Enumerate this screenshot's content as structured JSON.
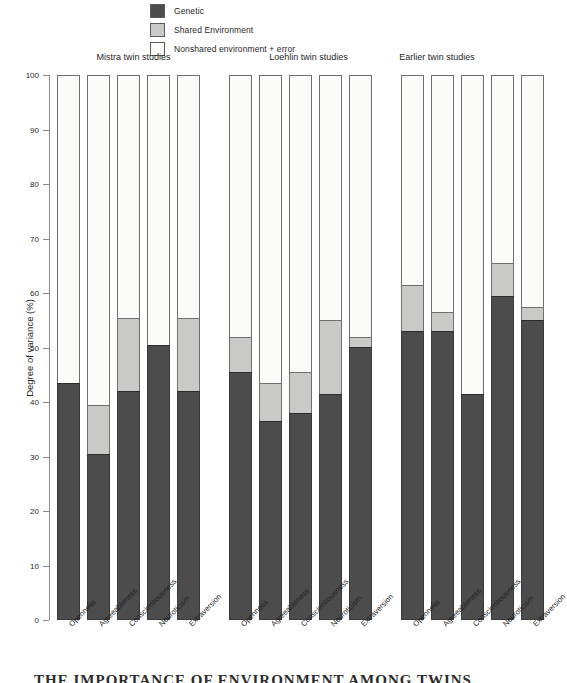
{
  "legend": {
    "items": [
      {
        "label": "Genetic",
        "color": "#4c4c4c",
        "key": "genetic"
      },
      {
        "label": "Shared Environment",
        "color": "#c9c9c7",
        "key": "shared"
      },
      {
        "label": "Nonshared environment + error",
        "color": "#fbfbfa",
        "key": "nonshared"
      }
    ]
  },
  "axis": {
    "ylabel": "Degree of variance (%)",
    "ticks": [
      "100",
      "90",
      "80",
      "70",
      "60",
      "50",
      "40",
      "30",
      "20",
      "10",
      "0"
    ]
  },
  "groups": [
    {
      "title": "Mistra twin studies"
    },
    {
      "title": "Loehlin twin studies"
    },
    {
      "title": "Earlier twin studies"
    }
  ],
  "traits": [
    "Openness",
    "Agreeableness",
    "Conscientiousness",
    "Neuroticism",
    "Extraversion"
  ],
  "footer": {
    "caption": "THE IMPORTANCE OF ENVIRONMENT AMONG TWINS"
  },
  "chart_data": {
    "type": "bar",
    "subtype": "stacked-bar",
    "title": "",
    "xlabel": "",
    "ylabel": "Degree of variance (%)",
    "ylim": [
      0,
      100
    ],
    "ytick_step": 10,
    "grid": false,
    "legend_position": "top-center",
    "stack_order_bottom_to_top": [
      "Genetic",
      "Shared Environment",
      "Nonshared environment + error"
    ],
    "categories": [
      "Openness",
      "Agreeableness",
      "Conscientiousness",
      "Neuroticism",
      "Extraversion"
    ],
    "groups": [
      {
        "name": "Mistra twin studies",
        "bars": [
          {
            "category": "Openness",
            "genetic": 43.5,
            "shared": 0.0,
            "nonshared": 56.5
          },
          {
            "category": "Agreeableness",
            "genetic": 30.5,
            "shared": 9.0,
            "nonshared": 60.5
          },
          {
            "category": "Conscientiousness",
            "genetic": 42.0,
            "shared": 13.5,
            "nonshared": 44.5
          },
          {
            "category": "Neuroticism",
            "genetic": 50.5,
            "shared": 0.0,
            "nonshared": 49.5
          },
          {
            "category": "Extraversion",
            "genetic": 42.0,
            "shared": 13.5,
            "nonshared": 44.5
          }
        ]
      },
      {
        "name": "Loehlin twin studies",
        "bars": [
          {
            "category": "Openness",
            "genetic": 45.5,
            "shared": 6.5,
            "nonshared": 48.0
          },
          {
            "category": "Agreeableness",
            "genetic": 36.5,
            "shared": 7.0,
            "nonshared": 56.5
          },
          {
            "category": "Conscientiousness",
            "genetic": 38.0,
            "shared": 7.5,
            "nonshared": 54.5
          },
          {
            "category": "Neuroticism",
            "genetic": 41.5,
            "shared": 13.5,
            "nonshared": 45.0
          },
          {
            "category": "Extraversion",
            "genetic": 50.0,
            "shared": 2.0,
            "nonshared": 48.0
          }
        ]
      },
      {
        "name": "Earlier twin studies",
        "bars": [
          {
            "category": "Openness",
            "genetic": 53.0,
            "shared": 8.5,
            "nonshared": 38.5
          },
          {
            "category": "Agreeableness",
            "genetic": 53.0,
            "shared": 3.5,
            "nonshared": 43.5
          },
          {
            "category": "Conscientiousness",
            "genetic": 41.5,
            "shared": 0.0,
            "nonshared": 58.5
          },
          {
            "category": "Neuroticism",
            "genetic": 59.5,
            "shared": 6.0,
            "nonshared": 34.5
          },
          {
            "category": "Extraversion",
            "genetic": 55.0,
            "shared": 2.5,
            "nonshared": 42.5
          }
        ]
      }
    ]
  }
}
